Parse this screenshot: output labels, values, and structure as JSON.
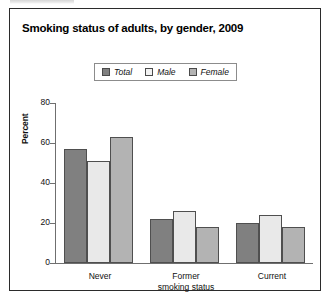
{
  "figure": {
    "title": "Smoking status of adults, by gender, 2009",
    "top_caption_fragment": ""
  },
  "chart_data": {
    "type": "bar",
    "title": "Smoking status of adults, by gender, 2009",
    "xlabel": "smoking status",
    "ylabel": "Percent",
    "ylim": [
      0,
      80
    ],
    "yticks": [
      0,
      20,
      40,
      60,
      80
    ],
    "ytick_labels": [
      "0",
      "20",
      "40",
      "60",
      "80"
    ],
    "grid": false,
    "legend_position": "top-center",
    "categories": [
      "Never",
      "Former",
      "Current"
    ],
    "series": [
      {
        "name": "Total",
        "color": "#808080",
        "values": [
          57,
          22,
          20
        ]
      },
      {
        "name": "Male",
        "color": "#e9e9e9",
        "values": [
          51,
          26,
          24
        ]
      },
      {
        "name": "Female",
        "color": "#b3b3b3",
        "values": [
          63,
          18,
          18
        ]
      }
    ]
  },
  "axis": {
    "y_title": "Percent",
    "x_title": "smoking status",
    "y_ticks": [
      {
        "label": "80",
        "value": 80
      },
      {
        "label": "60",
        "value": 60
      },
      {
        "label": "40",
        "value": 40
      },
      {
        "label": "20",
        "value": 20
      },
      {
        "label": "0",
        "value": 0
      }
    ],
    "x_categories": [
      "Never",
      "Former",
      "Current"
    ]
  },
  "legend": {
    "items": [
      {
        "label": "Total",
        "color": "#808080"
      },
      {
        "label": "Male",
        "color": "#f2f2f2"
      },
      {
        "label": "Female",
        "color": "#b3b3b3"
      }
    ]
  }
}
